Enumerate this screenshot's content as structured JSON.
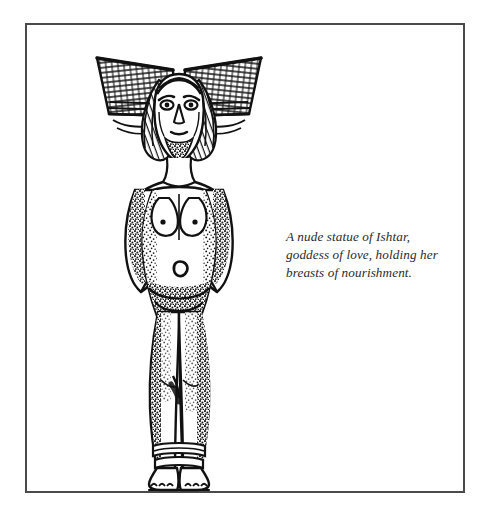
{
  "plate": {
    "background_color": "#ffffff",
    "border_color": "#4a4a4a",
    "ink_color": "#111111"
  },
  "illustration": {
    "name": "nude-statue-of-ishtar",
    "subject": "Ishtar",
    "description": "Line engraving of a standing nude female figure wearing a wide horned fan-shaped headdress, long hair falling over both shoulders, arms raised with hands cupping the breasts, wrist bracelets, stippled shading along the body and legs, ankle bracelets and bare feet.",
    "technique": "pen-and-ink engraving with stipple shading",
    "elements": [
      "fan-headdress-left",
      "fan-headdress-right",
      "face",
      "hair",
      "left-arm",
      "right-arm",
      "wrist-bracelets",
      "breasts",
      "navel",
      "hips",
      "legs",
      "ankle-bracelets",
      "feet"
    ]
  },
  "caption": {
    "name": "figure-caption",
    "lines": [
      "A nude statue of Ishtar,",
      "goddess of love, holding her",
      "breasts of nourishment."
    ],
    "full_text": "A nude statue of Ishtar, goddess of love, holding her breasts of nourishment.",
    "style": "italic-serif"
  }
}
